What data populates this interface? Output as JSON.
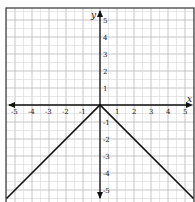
{
  "chart_data": {
    "type": "line",
    "title": "",
    "function": "y = -|x|",
    "xlabel": "x",
    "ylabel": "y",
    "xlim": [
      -5.5,
      5.5
    ],
    "ylim": [
      -5.5,
      5.5
    ],
    "grid": true,
    "grid_minor_step": 0.5,
    "grid_major_step": 1,
    "x_ticks": [
      "-5",
      "-4",
      "-3",
      "-2",
      "-1",
      "1",
      "2",
      "3",
      "4",
      "5"
    ],
    "y_ticks": [
      "5",
      "4",
      "3",
      "2",
      "1",
      "-1",
      "-2",
      "-3",
      "-4",
      "-5"
    ],
    "series": [
      {
        "name": "y = -|x|",
        "color": "#111111",
        "points": [
          [
            -5.5,
            -5.5
          ],
          [
            0,
            0
          ],
          [
            5.5,
            -5.5
          ]
        ]
      }
    ],
    "legend": "none"
  }
}
